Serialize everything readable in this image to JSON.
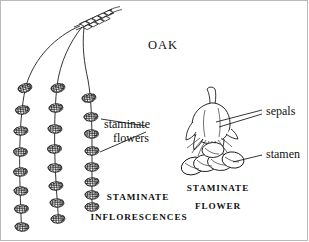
{
  "figure": {
    "title": "OAK",
    "background_color": "#ffffff",
    "ink_color": "#111111"
  },
  "labels": {
    "title": "OAK",
    "staminate_flowers": "staminate\nflowers",
    "staminate_flowers_line1": "staminate",
    "staminate_flowers_line2": "flowers",
    "staminate_inflorescences_line1": "STAMINATE",
    "staminate_inflorescences_line2": "INFLORESCENCES",
    "staminate_flower_line1": "STAMINATE",
    "staminate_flower_line2": "FLOWER",
    "sepals": "sepals",
    "stamen": "stamen"
  },
  "parts": {
    "catkin_count": 3,
    "catkin_names": [
      "left-catkin",
      "middle-catkin",
      "right-catkin"
    ],
    "flower_cluster_counts": [
      8,
      8,
      8
    ],
    "anther_count": 5,
    "sepal_lobe_count": 4,
    "twig_tip": "scaly bud tip"
  },
  "leaders": {
    "staminate_flowers_leader_count": 2,
    "sepals_leader_count": 2,
    "stamen_leader_count": 1
  }
}
